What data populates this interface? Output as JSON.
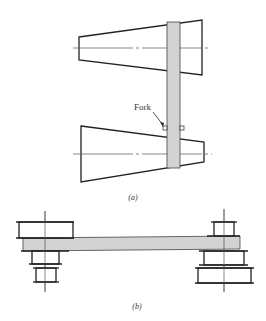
{
  "figure": {
    "part_a": {
      "caption": "(a)",
      "fork_label": "Fork"
    },
    "part_b": {
      "caption": "(b)"
    }
  },
  "colors": {
    "stroke": "#222222",
    "belt_fill": "#d3d3d3",
    "centerline": "#555555"
  }
}
